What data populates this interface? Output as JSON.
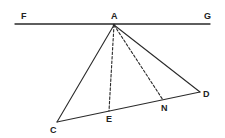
{
  "diagram": {
    "type": "geometry-figure",
    "colors": {
      "stroke": "#2a2a2a",
      "background": "#ffffff"
    },
    "points": {
      "F": {
        "label": "F",
        "x": 15,
        "y": 24,
        "lx": 21,
        "ly": 19
      },
      "G": {
        "label": "G",
        "x": 210,
        "y": 24,
        "lx": 204,
        "ly": 19
      },
      "A": {
        "label": "A",
        "x": 114,
        "y": 25,
        "lx": 111,
        "ly": 19
      },
      "C": {
        "label": "C",
        "x": 57,
        "y": 122,
        "lx": 50,
        "ly": 133
      },
      "D": {
        "label": "D",
        "x": 200,
        "y": 92,
        "lx": 203,
        "ly": 97
      },
      "E": {
        "label": "E",
        "x": 109,
        "y": 111,
        "lx": 106,
        "ly": 122
      },
      "N": {
        "label": "N",
        "x": 163,
        "y": 100,
        "lx": 161,
        "ly": 111
      }
    },
    "segments": [
      {
        "from": "F",
        "to": "G",
        "style": "solid"
      },
      {
        "from": "A",
        "to": "C",
        "style": "solid"
      },
      {
        "from": "A",
        "to": "D",
        "style": "solid"
      },
      {
        "from": "C",
        "to": "D",
        "style": "solid"
      },
      {
        "from": "A",
        "to": "E",
        "style": "dashed"
      },
      {
        "from": "A",
        "to": "N",
        "style": "dashed"
      }
    ]
  }
}
